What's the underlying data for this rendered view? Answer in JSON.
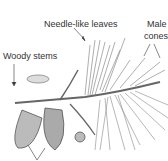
{
  "diagram": {
    "type": "labeled-illustration",
    "labels": [
      {
        "id": "needles",
        "text": "Needle-like leaves"
      },
      {
        "id": "male1",
        "text": "Male"
      },
      {
        "id": "male2",
        "text": "cones"
      },
      {
        "id": "stems",
        "text": "Woody stems"
      }
    ]
  }
}
